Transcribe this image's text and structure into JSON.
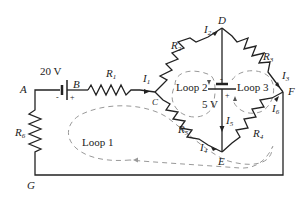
{
  "diagram": {
    "type": "circuit-schematic",
    "nodes": {
      "A": "A",
      "B": "B",
      "C": "C",
      "D": "D",
      "E": "E",
      "F": "F",
      "G": "G"
    },
    "sources": {
      "battery_main": {
        "label": "20 V",
        "neg": "-",
        "pos": "+"
      },
      "battery_middle": {
        "label": "5 V",
        "neg": "-",
        "pos": "+"
      }
    },
    "resistors": {
      "R1": {
        "base": "R",
        "sub": "1"
      },
      "R2": {
        "base": "R",
        "sub": "2"
      },
      "R3": {
        "base": "R",
        "sub": "3"
      },
      "R4": {
        "base": "R",
        "sub": "4"
      },
      "R5": {
        "base": "R",
        "sub": "5"
      },
      "R6": {
        "base": "R",
        "sub": "6"
      }
    },
    "currents": {
      "I1": {
        "base": "I",
        "sub": "1"
      },
      "I2": {
        "base": "I",
        "sub": "2"
      },
      "I3": {
        "base": "I",
        "sub": "3"
      },
      "I4": {
        "base": "I",
        "sub": "4"
      },
      "I5": {
        "base": "I",
        "sub": "5"
      },
      "I6": {
        "base": "I",
        "sub": "6"
      }
    },
    "loops": {
      "loop1": "Loop 1",
      "loop2": "Loop 2",
      "loop3": "Loop 3"
    },
    "colors": {
      "wire": "#222222",
      "loop_dash": "#999999",
      "background": "#ffffff"
    }
  }
}
